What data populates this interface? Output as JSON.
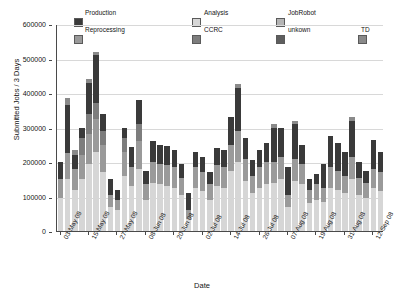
{
  "chart_data": {
    "type": "bar",
    "subtype": "stacked-vertical",
    "title": "",
    "xlabel": "Date",
    "ylabel": "Submitted Jobs / 3 Days",
    "ylim": [
      0,
      600000
    ],
    "yticks": [
      0,
      100000,
      200000,
      300000,
      400000,
      500000,
      600000
    ],
    "ytick_labels": [
      "0",
      "100000",
      "200000",
      "300000",
      "400000",
      "500000",
      "600000"
    ],
    "grid": true,
    "legend_position": "top",
    "legend": [
      "Production",
      "Reprocessing",
      "Analysis",
      "CCRC",
      "JobRobot",
      "unkown",
      "TD"
    ],
    "colors": {
      "Production": "#3a3a3a",
      "Reprocessing": "#9a9a9a",
      "Analysis": "#d6d6d6",
      "CCRC": "#7d7d7d",
      "JobRobot": "#b4b4b4",
      "unkown": "#5e5e5e",
      "TD": "#8a8a8a"
    },
    "x": [
      "03-May 08",
      "09-May 08",
      "15-May 08",
      "21-May 08",
      "27-May 08",
      "02-Jun 08",
      "08-Jun 08",
      "14-Jun 08",
      "20-Jun 08",
      "26-Jun 08",
      "02-Jul 08",
      "08-Jul 08",
      "14-Jul 08",
      "20-Jul 08",
      "26-Jul 08",
      "01-Aug 08",
      "07-Aug 08",
      "13-Aug 08",
      "19-Aug 08",
      "25-Aug 08",
      "31-Aug 08",
      "06-Sep 08",
      "12-Sep 08"
    ],
    "xtick_labels": [
      "03-May 08",
      "15-May 08",
      "27-May 08",
      "08-Jun 08",
      "20-Jun 08",
      "02-Jul 08",
      "14-Jul 08",
      "26-Jul 08",
      "07-Aug 08",
      "19-Aug 08",
      "31-Aug 08",
      "12-Sep 08"
    ],
    "xtick_every": 2,
    "n_bars": 46,
    "bars": [
      {
        "x": "03-May 08",
        "total": 200000,
        "segments": [
          {
            "name": "Analysis",
            "value": 95000
          },
          {
            "name": "Reprocessing",
            "value": 55000
          },
          {
            "name": "Production",
            "value": 50000
          }
        ]
      },
      {
        "x": "",
        "total": 385000,
        "segments": [
          {
            "name": "Analysis",
            "value": 150000
          },
          {
            "name": "Reprocessing",
            "value": 75000
          },
          {
            "name": "Production",
            "value": 140000
          },
          {
            "name": "TD",
            "value": 20000
          }
        ]
      },
      {
        "x": "09-May 08",
        "total": 235000,
        "segments": [
          {
            "name": "Analysis",
            "value": 120000
          },
          {
            "name": "Reprocessing",
            "value": 60000
          },
          {
            "name": "Production",
            "value": 40000
          },
          {
            "name": "TD",
            "value": 15000
          }
        ]
      },
      {
        "x": "",
        "total": 300000,
        "segments": [
          {
            "name": "Analysis",
            "value": 150000
          },
          {
            "name": "Reprocessing",
            "value": 70000
          },
          {
            "name": "CCRC",
            "value": 50000
          },
          {
            "name": "Production",
            "value": 30000
          }
        ]
      },
      {
        "x": "15-May 08",
        "total": 440000,
        "segments": [
          {
            "name": "Analysis",
            "value": 195000
          },
          {
            "name": "Reprocessing",
            "value": 85000
          },
          {
            "name": "CCRC",
            "value": 60000
          },
          {
            "name": "Production",
            "value": 90000
          },
          {
            "name": "TD",
            "value": 10000
          }
        ]
      },
      {
        "x": "",
        "total": 520000,
        "segments": [
          {
            "name": "Analysis",
            "value": 230000
          },
          {
            "name": "Reprocessing",
            "value": 95000
          },
          {
            "name": "CCRC",
            "value": 45000
          },
          {
            "name": "Production",
            "value": 140000
          },
          {
            "name": "TD",
            "value": 10000
          }
        ]
      },
      {
        "x": "",
        "total": 340000,
        "segments": [
          {
            "name": "Analysis",
            "value": 170000
          },
          {
            "name": "Reprocessing",
            "value": 80000
          },
          {
            "name": "CCRC",
            "value": 40000
          },
          {
            "name": "Production",
            "value": 50000
          }
        ]
      },
      {
        "x": "21-May 08",
        "total": 150000,
        "segments": [
          {
            "name": "Analysis",
            "value": 70000
          },
          {
            "name": "Reprocessing",
            "value": 35000
          },
          {
            "name": "Production",
            "value": 45000
          }
        ]
      },
      {
        "x": "",
        "total": 120000,
        "segments": [
          {
            "name": "Analysis",
            "value": 60000
          },
          {
            "name": "Reprocessing",
            "value": 30000
          },
          {
            "name": "Production",
            "value": 30000
          }
        ]
      },
      {
        "x": "27-May 08",
        "total": 300000,
        "segments": [
          {
            "name": "Analysis",
            "value": 160000
          },
          {
            "name": "Reprocessing",
            "value": 70000
          },
          {
            "name": "CCRC",
            "value": 40000
          },
          {
            "name": "Production",
            "value": 30000
          }
        ]
      },
      {
        "x": "",
        "total": 245000,
        "segments": [
          {
            "name": "Analysis",
            "value": 130000
          },
          {
            "name": "Reprocessing",
            "value": 55000
          },
          {
            "name": "Production",
            "value": 60000
          }
        ]
      },
      {
        "x": "",
        "total": 380000,
        "segments": [
          {
            "name": "Analysis",
            "value": 180000
          },
          {
            "name": "Reprocessing",
            "value": 80000
          },
          {
            "name": "CCRC",
            "value": 50000
          },
          {
            "name": "Production",
            "value": 70000
          }
        ]
      },
      {
        "x": "02-Jun 08",
        "total": 175000,
        "segments": [
          {
            "name": "Analysis",
            "value": 90000
          },
          {
            "name": "Reprocessing",
            "value": 45000
          },
          {
            "name": "Production",
            "value": 40000
          }
        ]
      },
      {
        "x": "",
        "total": 260000,
        "segments": [
          {
            "name": "Analysis",
            "value": 140000
          },
          {
            "name": "Reprocessing",
            "value": 60000
          },
          {
            "name": "Production",
            "value": 60000
          }
        ]
      },
      {
        "x": "08-Jun 08",
        "total": 250000,
        "segments": [
          {
            "name": "Analysis",
            "value": 135000
          },
          {
            "name": "Reprocessing",
            "value": 60000
          },
          {
            "name": "Production",
            "value": 55000
          }
        ]
      },
      {
        "x": "",
        "total": 245000,
        "segments": [
          {
            "name": "Analysis",
            "value": 130000
          },
          {
            "name": "Reprocessing",
            "value": 60000
          },
          {
            "name": "Production",
            "value": 55000
          }
        ]
      },
      {
        "x": "",
        "total": 235000,
        "segments": [
          {
            "name": "Analysis",
            "value": 125000
          },
          {
            "name": "Reprocessing",
            "value": 60000
          },
          {
            "name": "Production",
            "value": 50000
          }
        ]
      },
      {
        "x": "14-Jun 08",
        "total": 195000,
        "segments": [
          {
            "name": "Analysis",
            "value": 105000
          },
          {
            "name": "Reprocessing",
            "value": 50000
          },
          {
            "name": "Production",
            "value": 40000
          }
        ]
      },
      {
        "x": "",
        "total": 110000,
        "segments": [
          {
            "name": "Analysis",
            "value": 35000
          },
          {
            "name": "Reprocessing",
            "value": 25000
          },
          {
            "name": "Production",
            "value": 50000
          }
        ]
      },
      {
        "x": "20-Jun 08",
        "total": 230000,
        "segments": [
          {
            "name": "Analysis",
            "value": 125000
          },
          {
            "name": "Reprocessing",
            "value": 60000
          },
          {
            "name": "Production",
            "value": 45000
          }
        ]
      },
      {
        "x": "",
        "total": 215000,
        "segments": [
          {
            "name": "Analysis",
            "value": 115000
          },
          {
            "name": "Reprocessing",
            "value": 55000
          },
          {
            "name": "Production",
            "value": 45000
          }
        ]
      },
      {
        "x": "",
        "total": 170000,
        "segments": [
          {
            "name": "Analysis",
            "value": 90000
          },
          {
            "name": "Reprocessing",
            "value": 45000
          },
          {
            "name": "Production",
            "value": 35000
          }
        ]
      },
      {
        "x": "02-Jul 08",
        "total": 240000,
        "segments": [
          {
            "name": "Analysis",
            "value": 130000
          },
          {
            "name": "Reprocessing",
            "value": 60000
          },
          {
            "name": "Production",
            "value": 50000
          }
        ]
      },
      {
        "x": "",
        "total": 235000,
        "segments": [
          {
            "name": "Analysis",
            "value": 125000
          },
          {
            "name": "Reprocessing",
            "value": 60000
          },
          {
            "name": "Production",
            "value": 50000
          }
        ]
      },
      {
        "x": "",
        "total": 330000,
        "segments": [
          {
            "name": "Analysis",
            "value": 175000
          },
          {
            "name": "Reprocessing",
            "value": 75000
          },
          {
            "name": "Production",
            "value": 80000
          }
        ]
      },
      {
        "x": "08-Jul 08",
        "total": 425000,
        "segments": [
          {
            "name": "Analysis",
            "value": 200000
          },
          {
            "name": "Reprocessing",
            "value": 90000
          },
          {
            "name": "Production",
            "value": 125000
          },
          {
            "name": "TD",
            "value": 10000
          }
        ]
      },
      {
        "x": "14-Jul 08",
        "total": 270000,
        "segments": [
          {
            "name": "Analysis",
            "value": 145000
          },
          {
            "name": "Reprocessing",
            "value": 65000
          },
          {
            "name": "Production",
            "value": 60000
          }
        ]
      },
      {
        "x": "",
        "total": 205000,
        "segments": [
          {
            "name": "Analysis",
            "value": 110000
          },
          {
            "name": "Reprocessing",
            "value": 50000
          },
          {
            "name": "Production",
            "value": 45000
          }
        ]
      },
      {
        "x": "",
        "total": 235000,
        "segments": [
          {
            "name": "Analysis",
            "value": 125000
          },
          {
            "name": "Reprocessing",
            "value": 60000
          },
          {
            "name": "Production",
            "value": 50000
          }
        ]
      },
      {
        "x": "20-Jul 08",
        "total": 255000,
        "segments": [
          {
            "name": "Analysis",
            "value": 135000
          },
          {
            "name": "Reprocessing",
            "value": 65000
          },
          {
            "name": "Production",
            "value": 55000
          }
        ]
      },
      {
        "x": "",
        "total": 310000,
        "segments": [
          {
            "name": "Analysis",
            "value": 140000
          },
          {
            "name": "Reprocessing",
            "value": 60000
          },
          {
            "name": "Production",
            "value": 100000
          },
          {
            "name": "TD",
            "value": 10000
          }
        ]
      },
      {
        "x": "26-Jul 08",
        "total": 300000,
        "segments": [
          {
            "name": "Analysis",
            "value": 150000
          },
          {
            "name": "Reprocessing",
            "value": 65000
          },
          {
            "name": "Production",
            "value": 85000
          }
        ]
      },
      {
        "x": "",
        "total": 185000,
        "segments": [
          {
            "name": "Analysis",
            "value": 70000
          },
          {
            "name": "Reprocessing",
            "value": 35000
          },
          {
            "name": "Production",
            "value": 80000
          }
        ]
      },
      {
        "x": "",
        "total": 320000,
        "segments": [
          {
            "name": "Analysis",
            "value": 145000
          },
          {
            "name": "Reprocessing",
            "value": 65000
          },
          {
            "name": "Production",
            "value": 100000
          },
          {
            "name": "TD",
            "value": 10000
          }
        ]
      },
      {
        "x": "01-Aug 08",
        "total": 250000,
        "segments": [
          {
            "name": "Analysis",
            "value": 135000
          },
          {
            "name": "Reprocessing",
            "value": 60000
          },
          {
            "name": "Production",
            "value": 55000
          }
        ]
      },
      {
        "x": "07-Aug 08",
        "total": 150000,
        "segments": [
          {
            "name": "Analysis",
            "value": 80000
          },
          {
            "name": "Reprocessing",
            "value": 40000
          },
          {
            "name": "Production",
            "value": 30000
          }
        ]
      },
      {
        "x": "",
        "total": 165000,
        "segments": [
          {
            "name": "Analysis",
            "value": 90000
          },
          {
            "name": "Reprocessing",
            "value": 45000
          },
          {
            "name": "Production",
            "value": 30000
          }
        ]
      },
      {
        "x": "13-Aug 08",
        "total": 195000,
        "segments": [
          {
            "name": "Analysis",
            "value": 85000
          },
          {
            "name": "Reprocessing",
            "value": 40000
          },
          {
            "name": "Production",
            "value": 70000
          }
        ]
      },
      {
        "x": "",
        "total": 275000,
        "segments": [
          {
            "name": "Analysis",
            "value": 125000
          },
          {
            "name": "Reprocessing",
            "value": 60000
          },
          {
            "name": "Production",
            "value": 90000
          }
        ]
      },
      {
        "x": "19-Aug 08",
        "total": 255000,
        "segments": [
          {
            "name": "Analysis",
            "value": 120000
          },
          {
            "name": "Reprocessing",
            "value": 55000
          },
          {
            "name": "Production",
            "value": 80000
          }
        ]
      },
      {
        "x": "",
        "total": 230000,
        "segments": [
          {
            "name": "Analysis",
            "value": 110000
          },
          {
            "name": "Reprocessing",
            "value": 50000
          },
          {
            "name": "Production",
            "value": 70000
          }
        ]
      },
      {
        "x": "",
        "total": 330000,
        "segments": [
          {
            "name": "Analysis",
            "value": 150000
          },
          {
            "name": "Reprocessing",
            "value": 65000
          },
          {
            "name": "Production",
            "value": 105000
          },
          {
            "name": "TD",
            "value": 10000
          }
        ]
      },
      {
        "x": "25-Aug 08",
        "total": 200000,
        "segments": [
          {
            "name": "Analysis",
            "value": 105000
          },
          {
            "name": "Reprocessing",
            "value": 50000
          },
          {
            "name": "Production",
            "value": 45000
          }
        ]
      },
      {
        "x": "31-Aug 08",
        "total": 175000,
        "segments": [
          {
            "name": "Analysis",
            "value": 95000
          },
          {
            "name": "Reprocessing",
            "value": 45000
          },
          {
            "name": "Production",
            "value": 35000
          }
        ]
      },
      {
        "x": "06-Sep 08",
        "total": 265000,
        "segments": [
          {
            "name": "Analysis",
            "value": 125000
          },
          {
            "name": "Reprocessing",
            "value": 55000
          },
          {
            "name": "Production",
            "value": 85000
          }
        ]
      },
      {
        "x": "12-Sep 08",
        "total": 230000,
        "segments": [
          {
            "name": "Analysis",
            "value": 115000
          },
          {
            "name": "Reprocessing",
            "value": 55000
          },
          {
            "name": "Production",
            "value": 60000
          }
        ]
      }
    ]
  }
}
